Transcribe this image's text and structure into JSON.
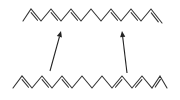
{
  "diagram": {
    "type": "chemical-structure-transformation",
    "colors": {
      "bond": "#333333",
      "arrow": "#222222",
      "background": "#ffffff"
    },
    "top_chain": {
      "points": [
        [
          23,
          21
        ],
        [
          31,
          9
        ],
        [
          41,
          21
        ],
        [
          51,
          9
        ],
        [
          61,
          21
        ],
        [
          71,
          9
        ],
        [
          81,
          21
        ],
        [
          91,
          9
        ],
        [
          101,
          21
        ],
        [
          111,
          9
        ],
        [
          121,
          21
        ],
        [
          131,
          9
        ],
        [
          141,
          21
        ],
        [
          151,
          9
        ],
        [
          162,
          23
        ]
      ],
      "double_bonds": [
        [
          1,
          2
        ],
        [
          3,
          4
        ],
        [
          5,
          6
        ],
        [
          9,
          10
        ],
        [
          11,
          12
        ],
        [
          13,
          14
        ]
      ]
    },
    "bottom_chain": {
      "points": [
        [
          13,
          88
        ],
        [
          22,
          76
        ],
        [
          32,
          88
        ],
        [
          42,
          76
        ],
        [
          52,
          88
        ],
        [
          62,
          76
        ],
        [
          72,
          88
        ],
        [
          82,
          76
        ],
        [
          92,
          88
        ],
        [
          102,
          76
        ],
        [
          112,
          88
        ],
        [
          122,
          76
        ],
        [
          132,
          88
        ],
        [
          142,
          76
        ],
        [
          152,
          88
        ],
        [
          160,
          76
        ],
        [
          167,
          88
        ]
      ],
      "double_bonds": [
        [
          1,
          2
        ],
        [
          3,
          4
        ],
        [
          5,
          6
        ],
        [
          10,
          11
        ],
        [
          12,
          13
        ],
        [
          14,
          15
        ]
      ]
    },
    "arrows": [
      {
        "from": [
          50,
          71
        ],
        "to": [
          61,
          31
        ]
      },
      {
        "from": [
          127,
          73
        ],
        "to": [
          122,
          31
        ]
      }
    ]
  }
}
